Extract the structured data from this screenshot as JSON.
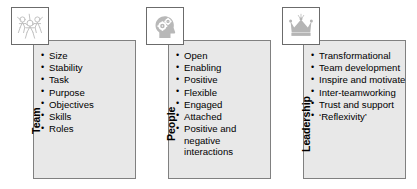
{
  "diagram": {
    "panel_fill": "#e8e8e8",
    "panel_border": "#808080",
    "icon_tile_border": "#6b6b6b",
    "icon_color": "#b3b3b3",
    "text_color": "#000000",
    "columns": [
      {
        "id": "team",
        "label": "Team",
        "icon": "group-of-people-icon",
        "items": [
          "Size",
          "Stability",
          "Task",
          "Purpose",
          "Objectives",
          "Skills",
          "Roles"
        ]
      },
      {
        "id": "people",
        "label": "People",
        "icon": "head-with-gears-icon",
        "items": [
          "Open",
          "Enabling",
          "Positive",
          "Flexible",
          "Engaged",
          "Attached",
          "Positive and negative interactions"
        ]
      },
      {
        "id": "leadership",
        "label": "Leadership",
        "icon": "crown-icon",
        "items": [
          "Transformational",
          "Team development",
          "Inspire and motivate",
          "Inter-teamworking",
          "Trust and support",
          "‘Reflexivity’"
        ]
      }
    ]
  }
}
